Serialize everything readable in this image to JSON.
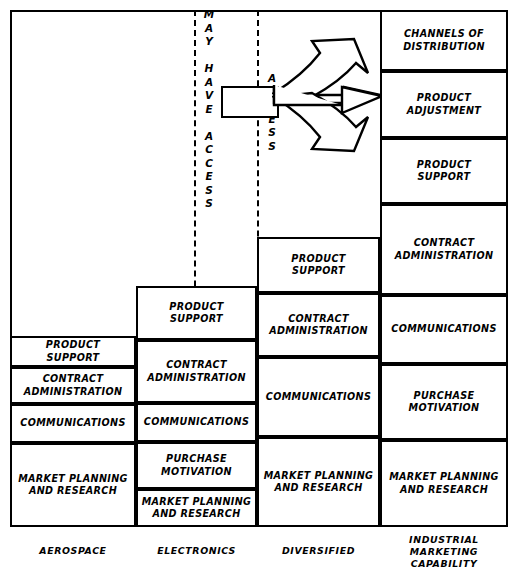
{
  "diagram": {
    "access_labels": {
      "may_have_access": "M\nA\nY\n\nH\nA\nV\nE\n\nA\nC\nC\nE\nS\nS",
      "access": "A\nC\nC\nE\nS\nS"
    },
    "center_box": {
      "label": ""
    },
    "arrow": {
      "name": "three-way-arrow",
      "prongs": 3,
      "direction": "right"
    },
    "columns": [
      {
        "id": "aerospace",
        "label": "AEROSPACE",
        "cells": [
          {
            "label": "PRODUCT\nSUPPORT"
          },
          {
            "label": "CONTRACT\nADMINISTRATION"
          },
          {
            "label": "COMMUNICATIONS"
          },
          {
            "label": "MARKET PLANNING\nAND RESEARCH"
          }
        ]
      },
      {
        "id": "electronics",
        "label": "ELECTRONICS",
        "cells": [
          {
            "label": "PRODUCT\nSUPPORT"
          },
          {
            "label": "CONTRACT\nADMINISTRATION"
          },
          {
            "label": "COMMUNICATIONS"
          },
          {
            "label": "PURCHASE\nMOTIVATION"
          },
          {
            "label": "MARKET PLANNING\nAND RESEARCH"
          }
        ]
      },
      {
        "id": "diversified",
        "label": "DIVERSIFIED",
        "cells": [
          {
            "label": "PRODUCT\nSUPPORT"
          },
          {
            "label": "CONTRACT\nADMINISTRATION"
          },
          {
            "label": "COMMUNICATIONS"
          },
          {
            "label": "MARKET PLANNING\nAND RESEARCH"
          }
        ]
      },
      {
        "id": "industrial-marketing-capability",
        "label": "INDUSTRIAL\nMARKETING\nCAPABILITY",
        "cells": [
          {
            "label": "CHANNELS OF\nDISTRIBUTION"
          },
          {
            "label": "PRODUCT\nADJUSTMENT"
          },
          {
            "label": "PRODUCT\nSUPPORT"
          },
          {
            "label": "CONTRACT\nADMINISTRATION"
          },
          {
            "label": "COMMUNICATIONS"
          },
          {
            "label": "PURCHASE\nMOTIVATION"
          },
          {
            "label": "MARKET PLANNING\nAND RESEARCH"
          }
        ]
      }
    ],
    "colors": {
      "ink": "#000000",
      "paper": "#ffffff"
    }
  }
}
